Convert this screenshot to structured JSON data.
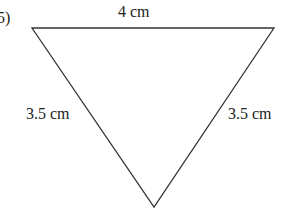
{
  "problem_number": "5)",
  "shape": "isosceles triangle (inverted)",
  "sides": {
    "top": "4 cm",
    "left": "3.5 cm",
    "right": "3.5 cm"
  },
  "colors": {
    "stroke": "#333333",
    "text": "#222222",
    "background": "#ffffff"
  }
}
